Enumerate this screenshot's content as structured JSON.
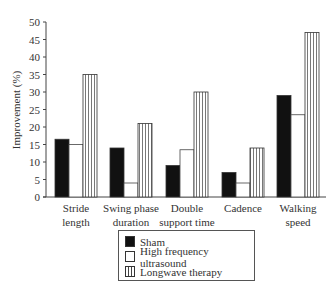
{
  "chart_data": {
    "type": "bar",
    "title": "",
    "xlabel": "",
    "ylabel": "Improvement (%)",
    "ylim": [
      0,
      50
    ],
    "yticks": [
      0,
      5,
      10,
      15,
      20,
      25,
      30,
      35,
      40,
      45,
      50
    ],
    "grid": false,
    "legend_position": "bottom-center",
    "categories": [
      [
        "Stride",
        "length"
      ],
      [
        "Swing phase",
        "duration"
      ],
      [
        "Double",
        "support time"
      ],
      [
        "Cadence"
      ],
      [
        "Walking",
        "speed"
      ]
    ],
    "series": [
      {
        "name": "Sham",
        "fill": "solid-black",
        "values": [
          16.5,
          14,
          9,
          7,
          29
        ]
      },
      {
        "name": "High frequency ultrasound",
        "fill": "white",
        "values": [
          15,
          4,
          13.5,
          4,
          23.5
        ]
      },
      {
        "name": "Longwave therapy",
        "fill": "vertical-stripes",
        "values": [
          35,
          21,
          30,
          14,
          47
        ]
      }
    ]
  },
  "legend": {
    "items": [
      {
        "label": "Sham"
      },
      {
        "label": "High frequency ultrasound"
      },
      {
        "label": "Longwave therapy"
      }
    ]
  }
}
